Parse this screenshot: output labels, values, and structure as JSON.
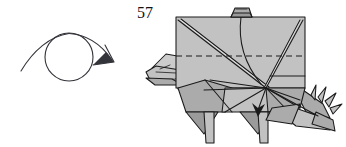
{
  "page": {
    "kind": "origami-instruction-step",
    "background_color": "#ffffff",
    "width": 346,
    "height": 147
  },
  "step": {
    "number": "57",
    "number_color": "#111111"
  },
  "symbols": {
    "turn_over": {
      "name": "turn-over-symbol",
      "description": "Looping arrow around a circle indicating turn the model over",
      "stroke_color": "#33333a",
      "circle": {
        "cx": 69,
        "cy": 57,
        "r": 24
      }
    }
  },
  "figure": {
    "name": "origami-dinosaur-model",
    "paper_fill": "#c2c2c2",
    "paper_fill_light": "#cccccc",
    "paper_fill_dark": "#a9a9a9",
    "paper_fill_darker": "#9a9a9a",
    "outline_color": "#1a1a1a",
    "fold_line_color": "#2a2a2a",
    "valley_fold_style": "dashed",
    "parts": [
      "body-panel",
      "head",
      "neck",
      "front-leg",
      "rear-leg",
      "tail",
      "tail-spikes",
      "top-tab"
    ],
    "annotations": {
      "valley_fold_line": "horizontal dashed line across body",
      "fold_arrow": "downward arrow from center convergence point"
    }
  }
}
